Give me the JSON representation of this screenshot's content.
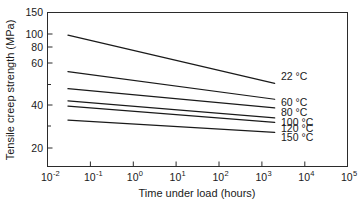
{
  "chart_data": {
    "type": "line",
    "title": "",
    "xlabel": "Time under load (hours)",
    "ylabel": "Tensile creep strength (MPa)",
    "xscale": "log",
    "yscale": "log",
    "xlim": [
      0.01,
      100000
    ],
    "ylim": [
      15,
      150
    ],
    "grid": false,
    "legend_position": "right-inline",
    "x_tick_labels": [
      "10-2",
      "10-1",
      "100",
      "101",
      "102",
      "103",
      "104",
      "105"
    ],
    "x_tick_bases": [
      "10",
      "10",
      "10",
      "10",
      "10",
      "10",
      "10",
      "10"
    ],
    "x_tick_exponents": [
      "-2",
      "-1",
      "0",
      "1",
      "2",
      "3",
      "4",
      "5"
    ],
    "x_tick_values": [
      0.01,
      0.1,
      1,
      10,
      100,
      1000,
      10000,
      100000
    ],
    "y_tick_labels": [
      "150",
      "100",
      "80",
      "60",
      "40",
      "20"
    ],
    "y_tick_values": [
      150,
      100,
      80,
      60,
      40,
      20
    ],
    "series": [
      {
        "name": "22 °C",
        "label": "22 °C",
        "x": [
          0.03,
          2000
        ],
        "values": [
          107,
          52
        ]
      },
      {
        "name": "60 °C",
        "label": "60 °C",
        "x": [
          0.03,
          2000
        ],
        "values": [
          62,
          41
        ]
      },
      {
        "name": "80 °C",
        "label": "80 °C",
        "x": [
          0.03,
          2000
        ],
        "values": [
          48,
          36
        ]
      },
      {
        "name": "100 °C",
        "label": "100 °C",
        "x": [
          0.03,
          2000
        ],
        "values": [
          40,
          31
        ]
      },
      {
        "name": "120 °C",
        "label": "120 °C",
        "x": [
          0.03,
          2000
        ],
        "values": [
          37,
          29
        ]
      },
      {
        "name": "150 °C",
        "label": "150 °C",
        "x": [
          0.03,
          2000
        ],
        "values": [
          30,
          25
        ]
      }
    ]
  },
  "axes": {
    "x_title": "Time under load (hours)",
    "y_title": "Tensile creep strength (MPa)"
  },
  "colors": {
    "background": "#ffffff",
    "frame": "#2b2b2b",
    "line": "#1a1a1a",
    "text": "#1a1a1a"
  }
}
